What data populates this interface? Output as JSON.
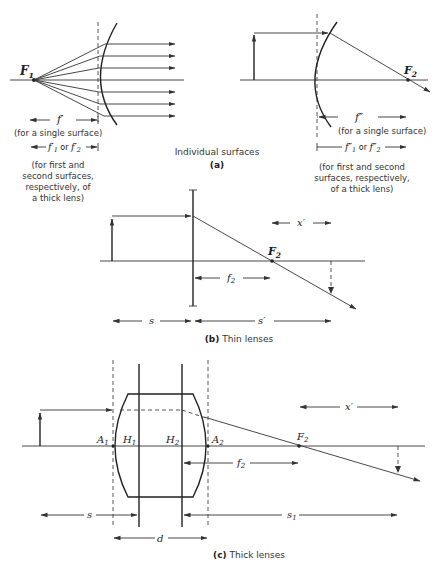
{
  "figure": {
    "panel_a": {
      "caption_text": "Individual surfaces",
      "caption_letter": "(a)",
      "left": {
        "focal_point": "F",
        "focal_point_sub": "1",
        "focal_length_label": "f′",
        "single_surface_note": "(for a single surface)",
        "thick_lens_labels": {
          "f1": "f′",
          "f1_sub": "1",
          "or": "or",
          "f2": "f′",
          "f2_sub": "2"
        },
        "thick_lens_note": [
          "(for first and",
          "second surfaces,",
          "respectively, of",
          "a thick lens)"
        ]
      },
      "right": {
        "focal_point": "F",
        "focal_point_sub": "2",
        "focal_length_label": "f″",
        "single_surface_note": "(for a single surface)",
        "thick_lens_labels": {
          "f1": "f″",
          "f1_sub": "1",
          "or": "or",
          "f2": "f″",
          "f2_sub": "2"
        },
        "thick_lens_note": [
          "(for first and second",
          "surfaces, respectively,",
          "of a thick lens)"
        ]
      }
    },
    "panel_b": {
      "caption_letter": "(b)",
      "caption_text": "Thin lenses",
      "focal_point": "F",
      "focal_point_sub": "2",
      "focal_length": "f",
      "focal_length_sub": "2",
      "x_prime": "x′",
      "s": "s",
      "s_prime": "s′"
    },
    "panel_c": {
      "caption_letter": "(c)",
      "caption_text": "Thick lenses",
      "vertex1": "A",
      "vertex1_sub": "1",
      "principal1": "H",
      "principal1_sub": "1",
      "principal2": "H",
      "principal2_sub": "2",
      "vertex2": "A",
      "vertex2_sub": "2",
      "focal_point": "F",
      "focal_point_sub": "2",
      "focal_length": "f",
      "focal_length_sub": "2",
      "x_prime": "x′",
      "s": "s",
      "s1": "s",
      "s1_sub": "1",
      "d": "d"
    }
  }
}
